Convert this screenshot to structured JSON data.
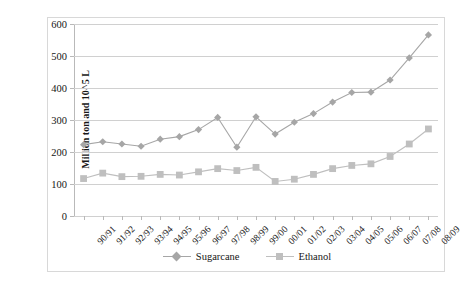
{
  "chart_data": {
    "type": "line",
    "title": "",
    "xlabel": "",
    "ylabel": "Million ton and 10^5 L",
    "ylim": [
      0,
      600
    ],
    "yticks": [
      0,
      100,
      200,
      300,
      400,
      500,
      600
    ],
    "grid": true,
    "legend_position": "bottom",
    "categories": [
      "90/91",
      "91/92",
      "92/93",
      "93/94",
      "94/95",
      "95/96",
      "96/97",
      "97/98",
      "98/99",
      "99/00",
      "00/01",
      "01/02",
      "02/03",
      "03/04",
      "04/05",
      "05/06",
      "06/07",
      "07/08",
      "08/09"
    ],
    "series": [
      {
        "name": "Sugarcane",
        "marker": "diamond",
        "color": "#a6a6a6",
        "values": [
          223,
          232,
          225,
          218,
          240,
          248,
          270,
          308,
          215,
          310,
          256,
          293,
          320,
          356,
          386,
          387,
          425,
          494,
          566
        ]
      },
      {
        "name": "Ethanol",
        "marker": "square",
        "color": "#bfbfbf",
        "values": [
          117,
          134,
          123,
          124,
          130,
          128,
          138,
          148,
          142,
          152,
          108,
          115,
          130,
          148,
          158,
          163,
          186,
          225,
          272
        ]
      }
    ]
  },
  "legend": {
    "items": [
      {
        "label": "Sugarcane"
      },
      {
        "label": "Ethanol"
      }
    ]
  },
  "axes": {
    "y_title": "Million ton and 10^5 L"
  }
}
